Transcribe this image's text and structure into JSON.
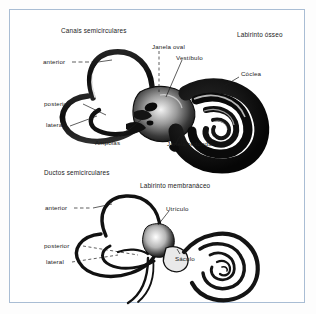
{
  "figure": {
    "background_color": "#ffffff",
    "frame_color": "#a9bdd4",
    "ink_color": "#101010"
  },
  "panels": [
    {
      "id": "bony-labyrinth",
      "title": "Labirinto ósseo",
      "group_heading": "Canais semicirculares",
      "labels": [
        {
          "key": "anterior",
          "text": "anterior"
        },
        {
          "key": "posterior",
          "text": "posterior"
        },
        {
          "key": "lateral",
          "text": "lateral"
        },
        {
          "key": "ampolas",
          "text": "Ampolas"
        },
        {
          "key": "janela_oval",
          "text": "Janela oval"
        },
        {
          "key": "vestibulo",
          "text": "Vestíbulo"
        },
        {
          "key": "coclea",
          "text": "Cóclea"
        },
        {
          "key": "janela_redonda",
          "text": "Janela redonda"
        }
      ]
    },
    {
      "id": "membranous-labyrinth",
      "title": "Labirinto membranáceo",
      "group_heading": "Ductos semicirculares",
      "labels": [
        {
          "key": "anterior",
          "text": "anterior"
        },
        {
          "key": "posterior",
          "text": "posterior"
        },
        {
          "key": "lateral",
          "text": "lateral"
        },
        {
          "key": "utriculo",
          "text": "Utrículo"
        },
        {
          "key": "saculo",
          "text": "Sáculo"
        }
      ]
    }
  ]
}
